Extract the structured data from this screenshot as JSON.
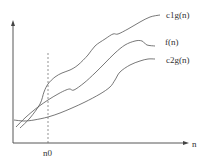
{
  "diagram": {
    "title": "",
    "type": "asymptotic-bound-illustration",
    "axes": {
      "x_label": "n",
      "y_label": ""
    },
    "threshold": {
      "label": "n0",
      "x": 48
    },
    "curves": [
      {
        "name": "upper-bound",
        "label": "c1g(n)",
        "color": "#555555",
        "points": [
          [
            20,
            128
          ],
          [
            30,
            118
          ],
          [
            40,
            104
          ],
          [
            44,
            92
          ],
          [
            48,
            84
          ],
          [
            55,
            77
          ],
          [
            62,
            73
          ],
          [
            70,
            70
          ],
          [
            78,
            65
          ],
          [
            88,
            55
          ],
          [
            95,
            46
          ],
          [
            105,
            39
          ],
          [
            113,
            34
          ],
          [
            118,
            34
          ],
          [
            128,
            29
          ],
          [
            140,
            22
          ],
          [
            150,
            17
          ],
          [
            160,
            15
          ]
        ]
      },
      {
        "name": "function",
        "label": "f(n)",
        "color": "#555555",
        "points": [
          [
            16,
            127
          ],
          [
            26,
            117
          ],
          [
            38,
            107
          ],
          [
            48,
            100
          ],
          [
            58,
            94
          ],
          [
            66,
            90
          ],
          [
            70,
            89
          ],
          [
            74,
            90
          ],
          [
            84,
            83
          ],
          [
            95,
            73
          ],
          [
            105,
            63
          ],
          [
            115,
            53
          ],
          [
            125,
            45
          ],
          [
            135,
            41
          ],
          [
            142,
            41
          ],
          [
            147,
            45
          ],
          [
            155,
            46
          ]
        ]
      },
      {
        "name": "lower-bound",
        "label": "c2g(n)",
        "color": "#555555",
        "points": [
          [
            14,
            120
          ],
          [
            24,
            121
          ],
          [
            34,
            120
          ],
          [
            48,
            117
          ],
          [
            60,
            113
          ],
          [
            72,
            108
          ],
          [
            85,
            102
          ],
          [
            100,
            94
          ],
          [
            110,
            87
          ],
          [
            115,
            80
          ],
          [
            120,
            72
          ],
          [
            130,
            65
          ],
          [
            140,
            61
          ],
          [
            148,
            59
          ],
          [
            155,
            59
          ]
        ]
      }
    ],
    "colors": {
      "axis": "#444444",
      "dashed_line": "#666666",
      "text": "#333333"
    }
  }
}
